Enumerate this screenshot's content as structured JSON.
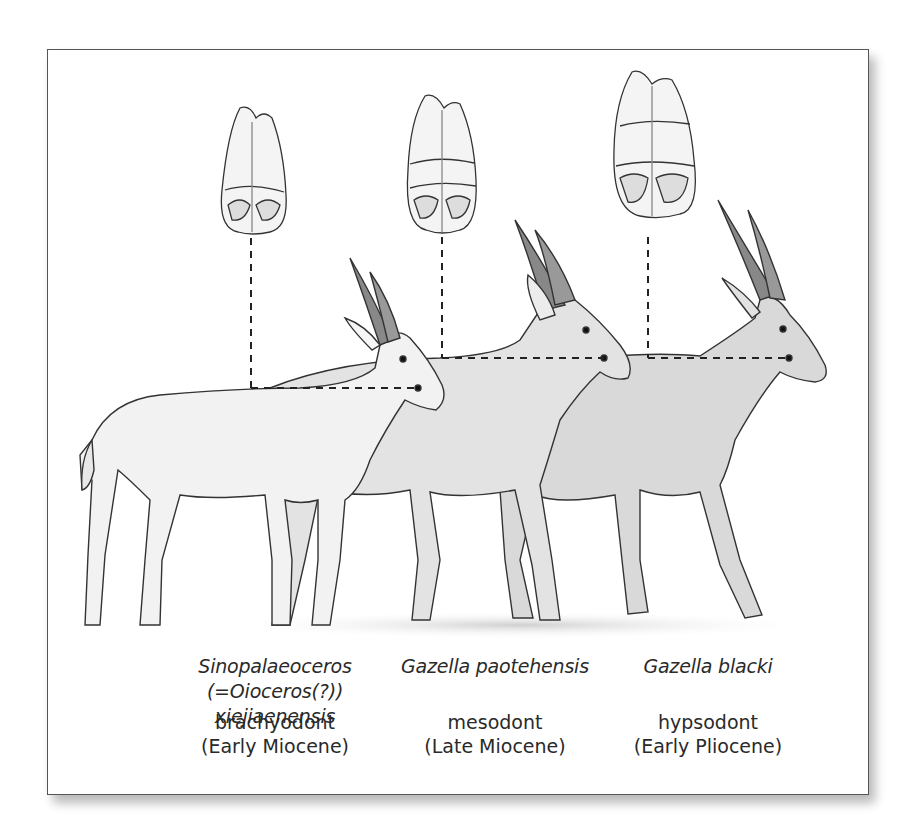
{
  "figure": {
    "frame_color": "#555555",
    "body_fill_colors": {
      "brachyodont_animal": "#f2f2f2",
      "mesodont_animal": "#e3e3e3",
      "hypsodont_animal": "#d9d9d9"
    },
    "columns": [
      {
        "species_line1": "Sinopalaeoceros",
        "species_line2": "(=Oioceros(?)) xiejiaenensis",
        "crown_type": "brachyodont",
        "epoch": "(Early Miocene)",
        "tooth_icon": "brachyodont-molar-icon",
        "animal_icon": "sinopalaeoceros-illustration-icon"
      },
      {
        "species_line1": "Gazella paotehensis",
        "species_line2": "",
        "crown_type": "mesodont",
        "epoch": "(Late Miocene)",
        "tooth_icon": "mesodont-molar-icon",
        "animal_icon": "gazella-paotehensis-illustration-icon"
      },
      {
        "species_line1": "Gazella blacki",
        "species_line2": "",
        "crown_type": "hypsodont",
        "epoch": "(Early Pliocene)",
        "tooth_icon": "hypsodont-molar-icon",
        "animal_icon": "gazella-blacki-illustration-icon"
      }
    ]
  }
}
